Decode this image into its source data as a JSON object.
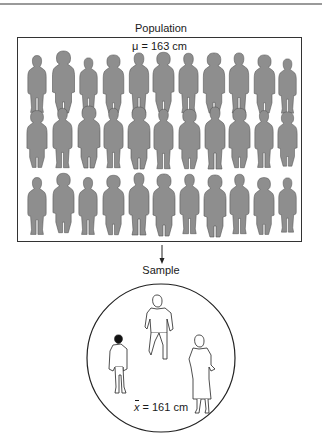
{
  "population": {
    "title": "Population",
    "mean_symbol": "μ",
    "mean_label": "μ = 163 cm",
    "mean_value_cm": 163,
    "rows": 3,
    "per_row": 11,
    "silhouette_color": "#8e8e8e",
    "outline_color": "#555555"
  },
  "arrow": {
    "direction": "down"
  },
  "sample": {
    "title": "Sample",
    "mean_symbol": "x",
    "mean_rest": " = 161 cm",
    "mean_value_cm": 161,
    "figures": [
      "man-in-jacket",
      "woman-in-suit-walking",
      "woman-in-dress"
    ]
  }
}
